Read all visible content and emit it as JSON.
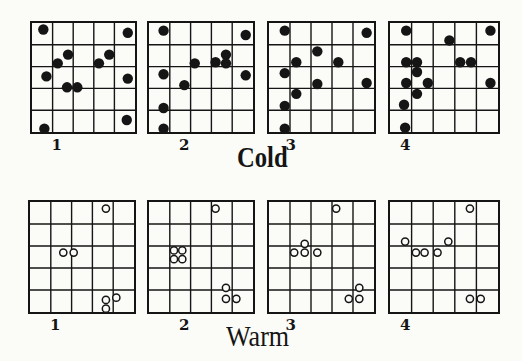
{
  "figure": {
    "rows": [
      {
        "label": "Cold",
        "marker": "filled",
        "panels": [
          {
            "number": "1",
            "box": [
              30,
              21,
              107,
              113
            ],
            "points": [
              [
                0.55,
                0.3
              ],
              [
                4.65,
                0.45
              ],
              [
                1.75,
                1.45
              ],
              [
                1.25,
                1.85
              ],
              [
                3.25,
                1.85
              ],
              [
                3.75,
                1.45
              ],
              [
                0.7,
                2.45
              ],
              [
                1.7,
                2.95
              ],
              [
                2.2,
                2.95
              ],
              [
                4.65,
                2.55
              ],
              [
                4.6,
                4.45
              ],
              [
                0.6,
                4.85
              ]
            ]
          },
          {
            "number": "2",
            "box": [
              147,
              21,
              108,
              113
            ],
            "points": [
              [
                0.7,
                0.35
              ],
              [
                4.65,
                0.55
              ],
              [
                3.7,
                1.45
              ],
              [
                3.2,
                1.8
              ],
              [
                3.7,
                1.85
              ],
              [
                2.2,
                1.85
              ],
              [
                0.7,
                2.35
              ],
              [
                1.7,
                2.85
              ],
              [
                4.65,
                2.4
              ],
              [
                0.7,
                3.9
              ],
              [
                0.7,
                4.85
              ]
            ]
          },
          {
            "number": "3",
            "box": [
              267,
              21,
              109,
              113
            ],
            "points": [
              [
                0.75,
                0.35
              ],
              [
                4.65,
                0.45
              ],
              [
                2.3,
                1.3
              ],
              [
                1.3,
                1.8
              ],
              [
                3.3,
                1.8
              ],
              [
                0.75,
                2.3
              ],
              [
                2.3,
                2.8
              ],
              [
                4.65,
                2.75
              ],
              [
                1.3,
                3.25
              ],
              [
                0.75,
                3.8
              ],
              [
                0.75,
                4.85
              ]
            ]
          },
          {
            "number": "4",
            "box": [
              388,
              21,
              112,
              113
            ],
            "points": [
              [
                0.75,
                0.35
              ],
              [
                2.75,
                0.8
              ],
              [
                4.65,
                0.35
              ],
              [
                0.75,
                1.8
              ],
              [
                1.25,
                1.8
              ],
              [
                3.25,
                1.8
              ],
              [
                3.75,
                1.8
              ],
              [
                1.25,
                2.25
              ],
              [
                0.75,
                2.75
              ],
              [
                1.75,
                2.75
              ],
              [
                4.65,
                2.75
              ],
              [
                1.25,
                3.25
              ],
              [
                0.65,
                3.75
              ],
              [
                0.7,
                4.8
              ]
            ]
          }
        ]
      },
      {
        "label": "Warm",
        "marker": "open",
        "panels": [
          {
            "number": "1",
            "box": [
              28,
              200,
              108,
              114
            ],
            "points": [
              [
                3.65,
                0.3
              ],
              [
                1.6,
                2.3
              ],
              [
                2.1,
                2.3
              ],
              [
                3.65,
                4.45
              ],
              [
                4.15,
                4.35
              ],
              [
                3.65,
                4.85
              ]
            ]
          },
          {
            "number": "2",
            "box": [
              147,
              200,
              108,
              114
            ],
            "points": [
              [
                3.2,
                0.3
              ],
              [
                1.2,
                2.2
              ],
              [
                1.6,
                2.2
              ],
              [
                1.2,
                2.6
              ],
              [
                1.6,
                2.6
              ],
              [
                3.7,
                3.9
              ],
              [
                3.7,
                4.4
              ],
              [
                4.2,
                4.4
              ]
            ]
          },
          {
            "number": "3",
            "box": [
              267,
              200,
              109,
              114
            ],
            "points": [
              [
                3.2,
                0.3
              ],
              [
                1.7,
                1.9
              ],
              [
                1.2,
                2.3
              ],
              [
                1.7,
                2.3
              ],
              [
                2.3,
                2.3
              ],
              [
                4.3,
                3.9
              ],
              [
                3.8,
                4.4
              ],
              [
                4.3,
                4.4
              ]
            ]
          },
          {
            "number": "4",
            "box": [
              388,
              200,
              112,
              114
            ],
            "points": [
              [
                3.7,
                0.3
              ],
              [
                0.7,
                1.8
              ],
              [
                2.7,
                1.8
              ],
              [
                1.2,
                2.3
              ],
              [
                1.6,
                2.3
              ],
              [
                2.2,
                2.3
              ],
              [
                3.7,
                4.4
              ],
              [
                4.2,
                4.4
              ]
            ]
          }
        ]
      }
    ],
    "grid_size": 5,
    "label_positions": {
      "Cold": [
        237,
        140
      ],
      "Warm": [
        226,
        320
      ]
    },
    "ink_color": "#151515",
    "background_color": "#fbfbf8"
  }
}
